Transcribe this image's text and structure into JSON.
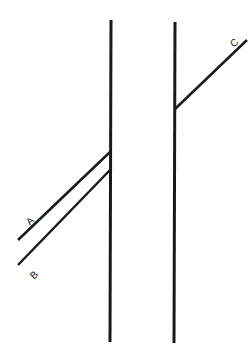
{
  "diagram": {
    "colors": {
      "line": "#1a1a1a",
      "background": "#ffffff"
    },
    "labels": {
      "a": "A",
      "b": "B",
      "c": "C"
    },
    "verticals": [
      {
        "name": "left-vertical",
        "x1": 111,
        "y1": 20,
        "x2": 110,
        "y2": 342
      },
      {
        "name": "right-vertical",
        "x1": 175,
        "y1": 22,
        "x2": 174,
        "y2": 343
      }
    ],
    "diagonals": [
      {
        "name": "line-a",
        "x1": 18,
        "y1": 240,
        "x2": 110,
        "y2": 152
      },
      {
        "name": "line-b",
        "x1": 18,
        "y1": 265,
        "x2": 110,
        "y2": 170
      },
      {
        "name": "line-c",
        "x1": 175,
        "y1": 109,
        "x2": 247,
        "y2": 40
      }
    ]
  }
}
